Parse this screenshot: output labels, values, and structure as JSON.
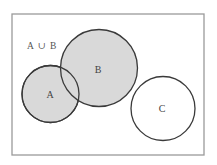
{
  "diagram": {
    "type": "venn",
    "universe": {
      "x": 12,
      "y": 14,
      "width": 192,
      "height": 141,
      "stroke": "#9a9a9a",
      "fill": "#ffffff"
    },
    "highlight_label": "A ∪ B",
    "highlight_fill": "#d9d9d9",
    "sets": [
      {
        "name": "A",
        "label": "A",
        "cx": 50.5,
        "cy": 94,
        "r": 28.5,
        "shaded": true,
        "fill": "#d9d9d9"
      },
      {
        "name": "B",
        "label": "B",
        "cx": 99,
        "cy": 68,
        "r": 38.5,
        "shaded": true,
        "fill": "#d9d9d9"
      },
      {
        "name": "C",
        "label": "C",
        "cx": 163,
        "cy": 108.5,
        "r": 32,
        "shaded": false,
        "fill": "#ffffff"
      }
    ]
  }
}
